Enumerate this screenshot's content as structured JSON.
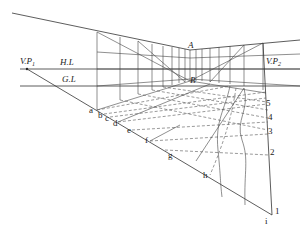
{
  "diagram": {
    "type": "two-point-perspective-grid",
    "labels": {
      "vp1": "V.P",
      "vp1_sub": "1",
      "vp2": "V.P",
      "vp2_sub": "2",
      "horizon_line": "H.L",
      "ground_line": "G.L",
      "corner_top": "A",
      "corner_bottom": "B"
    },
    "ground_points": [
      "a",
      "b",
      "c",
      "d",
      "e",
      "f",
      "g",
      "h",
      "i"
    ],
    "right_edge_numbers": [
      "1",
      "2",
      "3",
      "4",
      "5"
    ]
  }
}
